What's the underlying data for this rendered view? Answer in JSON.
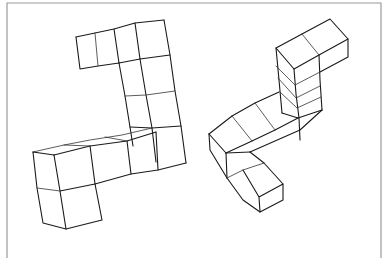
{
  "figure": {
    "left_shape": {
      "name": "L/S-shaped cube arrangement",
      "cube_count_visible": 12
    },
    "right_shape": {
      "name": "isometric bent polycube with stacked column",
      "cube_count_visible": 9
    },
    "colors": {
      "background": "#ffffff",
      "ink": "#1a1a1a",
      "frame": "#9a9a9a"
    }
  }
}
